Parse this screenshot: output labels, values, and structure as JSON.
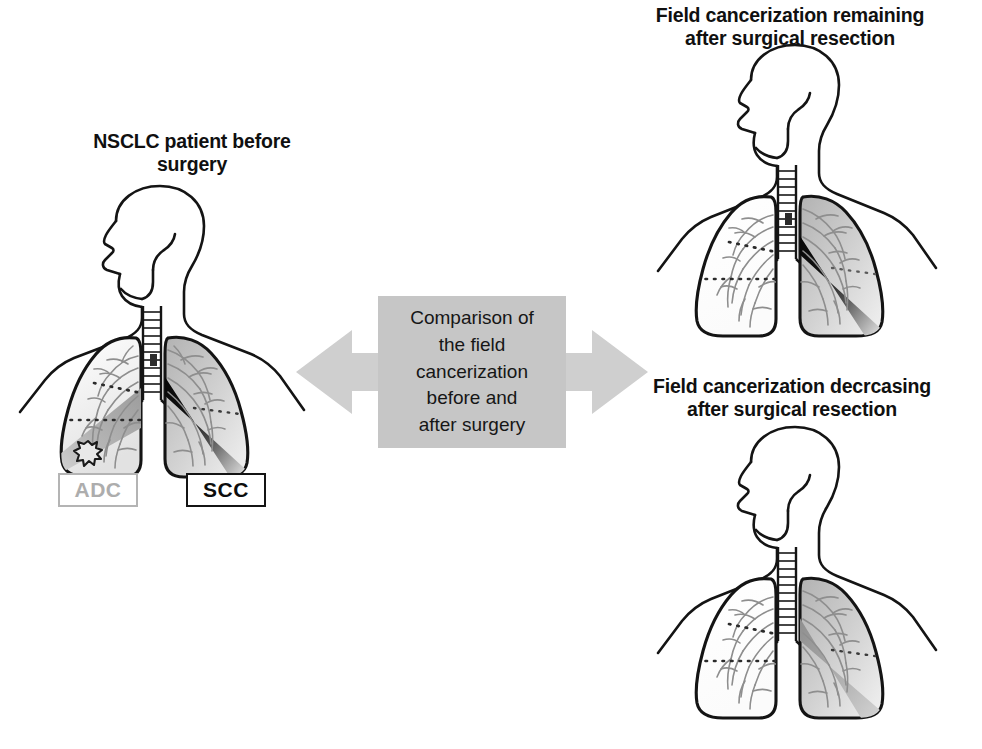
{
  "figure": {
    "kind": "medical-diagram",
    "background_color": "#ffffff"
  },
  "panels": {
    "before": {
      "caption": "NSCLC patient before\nsurgery",
      "lungs": {
        "left_lung_label": "ADC",
        "right_lung_label": "SCC",
        "left_lung_field": "gray wedge with spiculated nodule",
        "right_lung_field": "black wedge fading to gray"
      }
    },
    "after_remaining": {
      "caption": "Field cancerization remaining\nafter surgical resection",
      "lungs": {
        "left_lung_field": "cleared / white after resection",
        "right_lung_field": "black wedge fading to gray"
      }
    },
    "after_decreasing": {
      "caption": "Field cancerization decrcasing\nafter surgical resection",
      "lungs": {
        "left_lung_field": "cleared / white after resection",
        "right_lung_field": "medium gray wedge"
      }
    }
  },
  "center": {
    "comparison_text": "Comparison of\nthe field\ncancerization\nbefore and\nafter surgery",
    "box_color": "#c6c6c6",
    "arrow_color": "#cfcfcf",
    "arrow_direction": "bidirectional"
  },
  "tags": {
    "adc": {
      "label": "ADC",
      "text_color": "#adadad",
      "border_color": "#b4b4b4"
    },
    "scc": {
      "label": "SCC",
      "text_color": "#0d0d0d",
      "border_color": "#141414"
    }
  },
  "colors": {
    "outline": "#141414",
    "bronchial_tree": "#8e8e8e",
    "tumor_black": "#0a0a0a",
    "field_gray": "#9a9a9a",
    "lung_fill_light": "#efefef"
  }
}
